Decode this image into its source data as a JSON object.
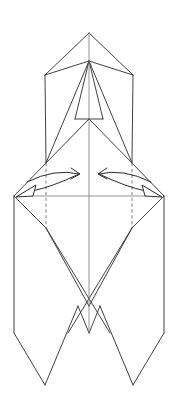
{
  "diagram": {
    "title": "Origami folding step",
    "canvas": {
      "width": 178,
      "height": 403
    },
    "colors": {
      "background": "#ffffff",
      "solid_fold_line": "#2b2b2b",
      "hidden_fold_line": "#6f6f6f",
      "center_axis_line": "#808080",
      "arrow_stroke": "#2b2b2b",
      "arrow_head_fill": "#ffffff"
    },
    "line_styles": {
      "solid": "visible edge / mountain crease",
      "dashed": "hidden edge behind layers",
      "axis": "vertical center reference line"
    },
    "labels": {
      "top_apex": "top point",
      "upper_body": "upper flap body",
      "inner_peak": "inner flap peak",
      "mid_band": "horizontal fold band",
      "lower_body": "lower flap body",
      "bottom_legs": "bottom splayed legs"
    },
    "annotations": {
      "left_arrow": {
        "name": "fold-arrow-left",
        "meaning": "fold left flap toward center",
        "direction": "right-then-out",
        "head_count": 2
      },
      "right_arrow": {
        "name": "fold-arrow-right",
        "meaning": "fold right flap toward center",
        "direction": "left-then-out",
        "head_count": 2
      }
    },
    "geometry": {
      "center_x": 89,
      "top_apex": [
        89,
        33
      ],
      "shoulder_left": [
        45,
        75
      ],
      "shoulder_right": [
        133,
        75
      ],
      "neck_point": [
        89,
        61
      ],
      "inner_peak": [
        89,
        119
      ],
      "waist_left": [
        46,
        163
      ],
      "waist_right": [
        132,
        163
      ],
      "wide_left": [
        14,
        196
      ],
      "wide_right": [
        164,
        196
      ],
      "mid_left": [
        46,
        228
      ],
      "mid_right": [
        132,
        228
      ],
      "center_v_bottom": [
        89,
        333
      ],
      "foot_left": [
        14,
        333
      ],
      "foot_right": [
        164,
        333
      ],
      "toe_left": [
        45,
        385
      ],
      "toe_right": [
        133,
        385
      ],
      "horizontal_band_y": 196,
      "axis_top_y": 33,
      "axis_bottom_y": 333
    },
    "counts": {
      "solid_segments": 34,
      "dashed_segments": 2,
      "arrows": 2,
      "arrow_heads": 4
    }
  }
}
